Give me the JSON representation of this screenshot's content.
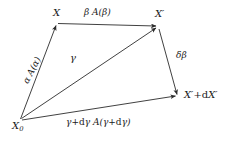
{
  "figure": {
    "type": "vector-quadrilateral-diagram",
    "background_color": "#ffffff",
    "line_color": "#2b2b2b",
    "text_color": "#1a1a1a",
    "width": 233,
    "height": 144
  },
  "vertices": [
    {
      "id": "X0",
      "label": "X",
      "subscript": "0",
      "x": 20,
      "y": 120
    },
    {
      "id": "X",
      "label": "X",
      "subscript": "",
      "x": 57,
      "y": 23
    },
    {
      "id": "Xprime",
      "label": "X′",
      "subscript": "",
      "x": 158,
      "y": 27
    },
    {
      "id": "XprimedX",
      "label": "X′+dX′",
      "subscript": "",
      "x": 178,
      "y": 97
    }
  ],
  "vertex_labels": {
    "x0": "X",
    "x0_sub": "0",
    "x": "X",
    "x_prime": "X′",
    "x_prime_plus_dx_prime_a": "X′+",
    "x_prime_plus_dx_prime_d": "d",
    "x_prime_plus_dx_prime_b": "X′"
  },
  "edge_labels": {
    "top": "β  A(β)",
    "left": "α  A(α)",
    "diagonal": "γ",
    "right": "δβ",
    "bottom_a": "γ+",
    "bottom_d1": "d",
    "bottom_b": "γ  A(γ+",
    "bottom_d2": "d",
    "bottom_c": "γ)"
  },
  "arrows": [
    {
      "name": "alpha-arrow",
      "from": "X0",
      "to": "X",
      "label": "α  A(α)"
    },
    {
      "name": "beta-arrow",
      "from": "X",
      "to": "Xprime",
      "label": "β  A(β)"
    },
    {
      "name": "gamma-arrow",
      "from": "X0",
      "to": "Xprime",
      "label": "γ"
    },
    {
      "name": "deltabeta-arrow",
      "from": "Xprime",
      "to": "XprimedX",
      "label": "δβ"
    },
    {
      "name": "gamma-dgamma-arrow",
      "from": "X0",
      "to": "XprimedX",
      "label": "γ+dγ  A(γ+dγ)"
    }
  ]
}
